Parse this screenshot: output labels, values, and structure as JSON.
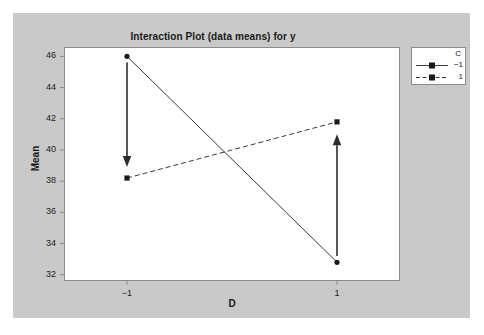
{
  "chart_data": {
    "type": "line",
    "title": "Interaction Plot (data means) for y",
    "xlabel": "D",
    "ylabel": "Mean",
    "categories": [
      "-1",
      "1"
    ],
    "x": [
      -1,
      1
    ],
    "xlim": [
      -1.6,
      1.6
    ],
    "ylim": [
      31.6,
      46.6
    ],
    "yticks": [
      32,
      34,
      36,
      38,
      40,
      42,
      44,
      46
    ],
    "xticks": [
      "−1",
      "1"
    ],
    "grid": false,
    "legend_position": "top-right-outside",
    "legend_title": "C",
    "series": [
      {
        "name": "−1",
        "values": [
          46.0,
          32.8
        ],
        "linestyle": "solid",
        "marker": "circle",
        "color": "#3a3a3a"
      },
      {
        "name": "1",
        "values": [
          38.2,
          41.8
        ],
        "linestyle": "dashed",
        "marker": "square",
        "color": "#3a3a3a"
      }
    ],
    "annotations": [
      {
        "name": "down-arrow-at-x-minus-1",
        "x": -1,
        "y_start": 45.6,
        "y_end": 38.9,
        "direction": "down"
      },
      {
        "name": "up-arrow-at-x-plus-1",
        "x": 1,
        "y_start": 33.2,
        "y_end": 41.0,
        "direction": "up"
      }
    ]
  },
  "legend": {
    "title": "C",
    "entries": [
      {
        "label": "−1"
      },
      {
        "label": "1"
      }
    ]
  },
  "colors": {
    "figure_background": "#c9c9c9",
    "plot_background": "#ffffff",
    "axis": "#8a8a8a",
    "line": "#3a3a3a",
    "text": "#1a1a1a"
  }
}
